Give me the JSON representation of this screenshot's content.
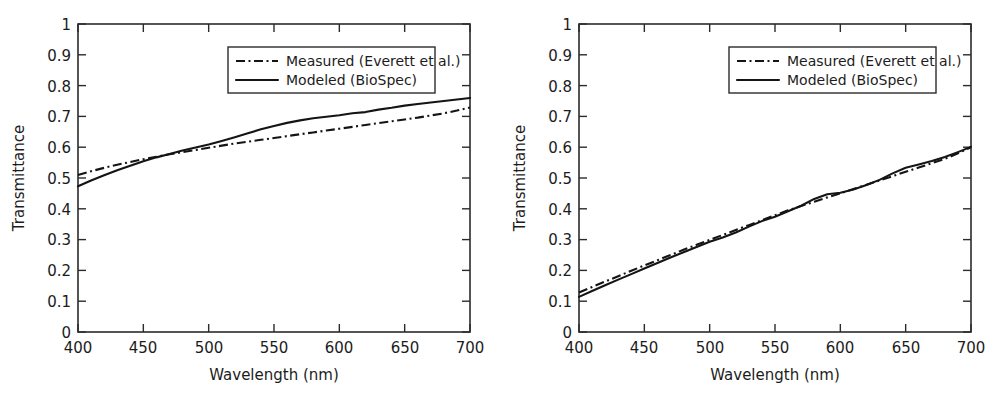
{
  "figure": {
    "background": "#ffffff",
    "line_color": "#141414",
    "axis_color": "#2b2b2b",
    "panel_count": 2
  },
  "axis_labels": {
    "x_title": "Wavelength (nm)",
    "y_title": "Transmittance",
    "x_ticks": [
      "400",
      "450",
      "500",
      "550",
      "600",
      "650",
      "700"
    ],
    "y_ticks": [
      "0",
      "0.1",
      "0.2",
      "0.3",
      "0.4",
      "0.5",
      "0.6",
      "0.7",
      "0.8",
      "0.9",
      "1"
    ]
  },
  "legend": {
    "measured_label": "Measured (Everett et al.)",
    "modeled_label": "Modeled (BioSpec)",
    "measured_style": "dash-dot",
    "modeled_style": "solid",
    "position": "upper-center"
  },
  "chart_data": [
    {
      "type": "line",
      "panel": "left",
      "title": "",
      "xlabel": "Wavelength (nm)",
      "ylabel": "Transmittance",
      "xlim": [
        400,
        700
      ],
      "ylim": [
        0,
        1
      ],
      "xticks": [
        400,
        450,
        500,
        550,
        600,
        650,
        700
      ],
      "yticks": [
        0,
        0.1,
        0.2,
        0.3,
        0.4,
        0.5,
        0.6,
        0.7,
        0.8,
        0.9,
        1
      ],
      "grid": false,
      "legend_position": "upper-center",
      "x": [
        400,
        410,
        420,
        430,
        440,
        450,
        460,
        470,
        480,
        490,
        500,
        510,
        520,
        530,
        540,
        550,
        560,
        570,
        580,
        590,
        600,
        610,
        620,
        630,
        640,
        650,
        660,
        670,
        680,
        690,
        700
      ],
      "series": [
        {
          "name": "Measured (Everett et al.)",
          "style": "dash-dot",
          "values": [
            0.51,
            0.522,
            0.533,
            0.543,
            0.552,
            0.561,
            0.569,
            0.577,
            0.584,
            0.591,
            0.598,
            0.605,
            0.612,
            0.618,
            0.624,
            0.63,
            0.636,
            0.642,
            0.648,
            0.654,
            0.66,
            0.666,
            0.672,
            0.678,
            0.684,
            0.69,
            0.696,
            0.703,
            0.71,
            0.719,
            0.729
          ]
        },
        {
          "name": "Modeled (BioSpec)",
          "style": "solid",
          "values": [
            0.473,
            0.492,
            0.509,
            0.525,
            0.54,
            0.554,
            0.567,
            0.578,
            0.589,
            0.599,
            0.609,
            0.62,
            0.632,
            0.645,
            0.658,
            0.669,
            0.679,
            0.687,
            0.694,
            0.699,
            0.704,
            0.71,
            0.714,
            0.722,
            0.728,
            0.735,
            0.74,
            0.745,
            0.75,
            0.755,
            0.76
          ]
        }
      ]
    },
    {
      "type": "line",
      "panel": "right",
      "title": "",
      "xlabel": "Wavelength (nm)",
      "ylabel": "Transmittance",
      "xlim": [
        400,
        700
      ],
      "ylim": [
        0,
        1
      ],
      "xticks": [
        400,
        450,
        500,
        550,
        600,
        650,
        700
      ],
      "yticks": [
        0,
        0.1,
        0.2,
        0.3,
        0.4,
        0.5,
        0.6,
        0.7,
        0.8,
        0.9,
        1
      ],
      "grid": false,
      "legend_position": "upper-center",
      "x": [
        400,
        410,
        420,
        430,
        440,
        450,
        460,
        470,
        480,
        490,
        500,
        510,
        520,
        530,
        540,
        550,
        560,
        570,
        580,
        590,
        600,
        610,
        620,
        630,
        640,
        650,
        660,
        670,
        680,
        690,
        700
      ],
      "series": [
        {
          "name": "Measured (Everett et al.)",
          "style": "dash-dot",
          "values": [
            0.128,
            0.146,
            0.164,
            0.181,
            0.199,
            0.216,
            0.233,
            0.25,
            0.267,
            0.283,
            0.299,
            0.315,
            0.331,
            0.347,
            0.363,
            0.379,
            0.395,
            0.409,
            0.423,
            0.437,
            0.45,
            0.464,
            0.478,
            0.492,
            0.506,
            0.52,
            0.534,
            0.548,
            0.562,
            0.58,
            0.6
          ]
        },
        {
          "name": "Modeled (BioSpec)",
          "style": "solid",
          "values": [
            0.114,
            0.133,
            0.152,
            0.17,
            0.188,
            0.206,
            0.224,
            0.242,
            0.259,
            0.276,
            0.293,
            0.307,
            0.323,
            0.342,
            0.36,
            0.374,
            0.392,
            0.41,
            0.432,
            0.447,
            0.452,
            0.463,
            0.477,
            0.494,
            0.515,
            0.533,
            0.544,
            0.555,
            0.568,
            0.584,
            0.601
          ]
        }
      ]
    }
  ]
}
